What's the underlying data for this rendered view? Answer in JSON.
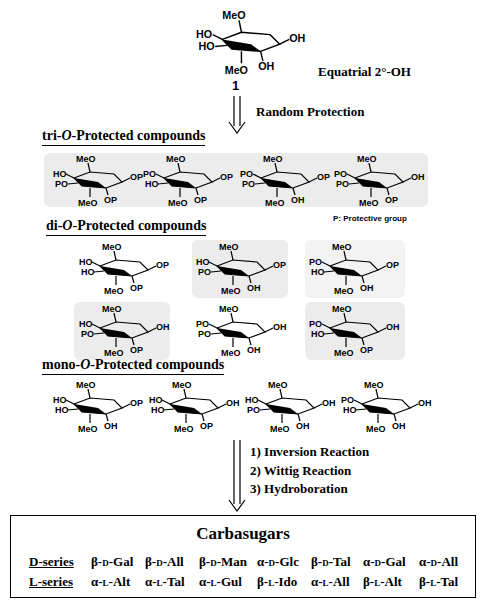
{
  "start": {
    "compound_number": "1",
    "label": "Equatrial 2°-OH",
    "substituents": {
      "top": "MeO",
      "left_upper": "HO",
      "left_lower": "HO",
      "bottom_left": "MeO",
      "bottom_right": "OH",
      "right": "OH"
    }
  },
  "step1": {
    "label": "Random Protection"
  },
  "tri": {
    "title": "tri-O-Protected compounds",
    "title_prefix": "tri-",
    "title_o": "O",
    "title_suffix": "-Protected compounds",
    "compounds": [
      {
        "top": "MeO",
        "left_upper": "HO",
        "left_lower": "PO",
        "bottom_left": "MeO",
        "bottom_right": "OP",
        "right": "OP"
      },
      {
        "top": "MeO",
        "left_upper": "PO",
        "left_lower": "HO",
        "bottom_left": "MeO",
        "bottom_right": "OP",
        "right": "OP"
      },
      {
        "top": "MeO",
        "left_upper": "PO",
        "left_lower": "PO",
        "bottom_left": "MeO",
        "bottom_right": "OH",
        "right": "OP"
      },
      {
        "top": "MeO",
        "left_upper": "PO",
        "left_lower": "PO",
        "bottom_left": "MeO",
        "bottom_right": "OP",
        "right": "OH"
      }
    ],
    "note": "P: Protective group"
  },
  "di": {
    "title_prefix": "di-",
    "title_o": "O",
    "title_suffix": "-Protected compounds",
    "compounds": [
      {
        "top": "MeO",
        "left_upper": "HO",
        "left_lower": "HO",
        "bottom_left": "MeO",
        "bottom_right": "OP",
        "right": "OP"
      },
      {
        "top": "MeO",
        "left_upper": "HO",
        "left_lower": "PO",
        "bottom_left": "MeO",
        "bottom_right": "OH",
        "right": "OP"
      },
      {
        "top": "MeO",
        "left_upper": "PO",
        "left_lower": "HO",
        "bottom_left": "MeO",
        "bottom_right": "OH",
        "right": "OP"
      },
      {
        "top": "MeO",
        "left_upper": "HO",
        "left_lower": "PO",
        "bottom_left": "MeO",
        "bottom_right": "OP",
        "right": "OH"
      },
      {
        "top": "MeO",
        "left_upper": "PO",
        "left_lower": "PO",
        "bottom_left": "MeO",
        "bottom_right": "OH",
        "right": "OH"
      },
      {
        "top": "MeO",
        "left_upper": "PO",
        "left_lower": "HO",
        "bottom_left": "MeO",
        "bottom_right": "OP",
        "right": "OH"
      }
    ]
  },
  "mono": {
    "title_prefix": "mono-",
    "title_o": "O",
    "title_suffix": "-Protected compounds",
    "compounds": [
      {
        "top": "MeO",
        "left_upper": "HO",
        "left_lower": "HO",
        "bottom_left": "MeO",
        "bottom_right": "OH",
        "right": "OP"
      },
      {
        "top": "MeO",
        "left_upper": "HO",
        "left_lower": "HO",
        "bottom_left": "MeO",
        "bottom_right": "OP",
        "right": "OH"
      },
      {
        "top": "MeO",
        "left_upper": "HO",
        "left_lower": "PO",
        "bottom_left": "MeO",
        "bottom_right": "OH",
        "right": "OH"
      },
      {
        "top": "MeO",
        "left_upper": "PO",
        "left_lower": "HO",
        "bottom_left": "MeO",
        "bottom_right": "OH",
        "right": "OH"
      }
    ]
  },
  "steps2": [
    "1) Inversion Reaction",
    "2) Wittig Reaction",
    "3) Hydroboration"
  ],
  "result": {
    "title": "Carbasugars",
    "d_series": {
      "label": "D-series",
      "items": [
        {
          "anomer": "β-",
          "config": "D",
          "name": "-Gal"
        },
        {
          "anomer": "β-",
          "config": "D",
          "name": "-All"
        },
        {
          "anomer": "β-",
          "config": "D",
          "name": "-Man"
        },
        {
          "anomer": "α-",
          "config": "D",
          "name": "-Glc"
        },
        {
          "anomer": "β-",
          "config": "D",
          "name": "-Tal"
        },
        {
          "anomer": "α-",
          "config": "D",
          "name": "-Gal"
        },
        {
          "anomer": "α-",
          "config": "D",
          "name": "-All"
        }
      ]
    },
    "l_series": {
      "label": "L-series",
      "items": [
        {
          "anomer": "α-",
          "config": "L",
          "name": "-Alt"
        },
        {
          "anomer": "α-",
          "config": "L",
          "name": "-Tal"
        },
        {
          "anomer": "α-",
          "config": "L",
          "name": "-Gul"
        },
        {
          "anomer": "β-",
          "config": "L",
          "name": "-Ido"
        },
        {
          "anomer": "α-",
          "config": "L",
          "name": "-All"
        },
        {
          "anomer": "β-",
          "config": "L",
          "name": "-Alt"
        },
        {
          "anomer": "β-",
          "config": "L",
          "name": "-Tal"
        }
      ]
    }
  },
  "colors": {
    "highlight": "#ececec",
    "ink": "#000000"
  }
}
